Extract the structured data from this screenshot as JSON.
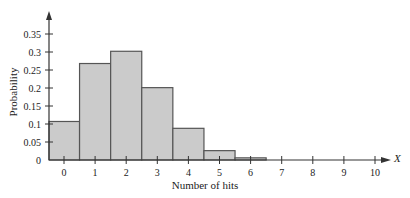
{
  "chart_data": {
    "type": "bar",
    "title": "",
    "xlabel": "Number of hits",
    "ylabel": "Probability",
    "x_axis_variable": "X",
    "categories": [
      "0",
      "1",
      "2",
      "3",
      "4",
      "5",
      "6",
      "7",
      "8",
      "9",
      "10"
    ],
    "values": [
      0.107,
      0.268,
      0.302,
      0.201,
      0.088,
      0.026,
      0.006,
      0.001,
      0.0,
      0.0,
      0.0
    ],
    "yticks": [
      "0",
      "0.05",
      "0.1",
      "0.15",
      "0.2",
      "0.25",
      "0.3",
      "0.35"
    ],
    "ylim": [
      0,
      0.38
    ],
    "grid": false,
    "legend": null,
    "bar_fill": "#cbcbcb",
    "bar_stroke": "#555555",
    "axis_color": "#333333"
  }
}
